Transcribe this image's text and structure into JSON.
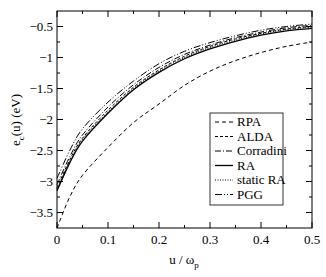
{
  "chart_data": {
    "type": "line",
    "title": "",
    "xlabel": "u / ω_p",
    "xlabel_main": "u / ω",
    "xlabel_sub": "p",
    "ylabel": "e_c(u) (eV)",
    "ylabel_main": "e",
    "ylabel_sub": "c",
    "ylabel_rest": "(u)  (eV)",
    "xlim": [
      0,
      0.5
    ],
    "ylim": [
      -3.75,
      -0.25
    ],
    "xticks": [
      0,
      0.1,
      0.2,
      0.3,
      0.4,
      0.5
    ],
    "xtick_labels": [
      "0",
      "0.1",
      "0.2",
      "0.3",
      "0.4",
      "0.5"
    ],
    "yticks": [
      -3.5,
      -3,
      -2.5,
      -2,
      -1.5,
      -1,
      -0.5
    ],
    "ytick_labels": [
      "-3.5",
      "-3",
      "-2.5",
      "-2",
      "-1.5",
      "-1",
      "-0.5"
    ],
    "grid": false,
    "legend_position": "center-right",
    "x": [
      0,
      0.025,
      0.05,
      0.1,
      0.15,
      0.2,
      0.25,
      0.3,
      0.35,
      0.4,
      0.45,
      0.5
    ],
    "series": [
      {
        "name": "RPA",
        "dash": "4,3",
        "width": 1,
        "values": [
          -3.75,
          -3.25,
          -2.9,
          -2.45,
          -2.05,
          -1.75,
          -1.45,
          -1.22,
          -1.05,
          -0.92,
          -0.82,
          -0.75
        ]
      },
      {
        "name": "ALDA",
        "dash": "3,2",
        "width": 1,
        "values": [
          -3.1,
          -2.65,
          -2.3,
          -1.85,
          -1.48,
          -1.2,
          -0.98,
          -0.82,
          -0.7,
          -0.61,
          -0.54,
          -0.5
        ]
      },
      {
        "name": "Corradini",
        "dash": "6,2,1,2",
        "width": 1,
        "values": [
          -3.05,
          -2.6,
          -2.25,
          -1.8,
          -1.44,
          -1.16,
          -0.95,
          -0.8,
          -0.68,
          -0.59,
          -0.52,
          -0.48
        ]
      },
      {
        "name": "RA",
        "dash": "",
        "width": 1.3,
        "values": [
          -3.15,
          -2.7,
          -2.35,
          -1.9,
          -1.52,
          -1.24,
          -1.02,
          -0.86,
          -0.74,
          -0.64,
          -0.57,
          -0.53
        ]
      },
      {
        "name": "static RA",
        "dash": "1,1.5",
        "width": 1,
        "values": [
          -3.12,
          -2.68,
          -2.32,
          -1.88,
          -1.5,
          -1.22,
          -1.0,
          -0.84,
          -0.72,
          -0.62,
          -0.55,
          -0.51
        ]
      },
      {
        "name": "PGG",
        "dash": "7,2,1,2,1,2",
        "width": 1,
        "values": [
          -2.95,
          -2.5,
          -2.15,
          -1.72,
          -1.38,
          -1.1,
          -0.9,
          -0.76,
          -0.65,
          -0.56,
          -0.5,
          -0.46
        ]
      }
    ]
  },
  "legend": {
    "items": [
      "RPA",
      "ALDA",
      "Corradini",
      "RA",
      "static RA",
      "PGG"
    ]
  }
}
